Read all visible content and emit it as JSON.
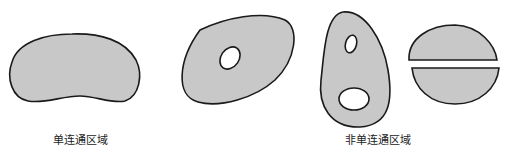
{
  "figure": {
    "colors": {
      "region_fill": "#c8c8c8",
      "outline": "#1a1a1a",
      "hole_fill": "#ffffff",
      "background": "#ffffff"
    },
    "groups": [
      {
        "label": "单连通区域",
        "shapes": [
          "bean-shaped region without holes"
        ]
      },
      {
        "label": "非单连通区域",
        "shapes": [
          "tilted oval region with one hole",
          "egg-shaped region with two holes",
          "ellipse split into two disconnected halves"
        ]
      }
    ]
  }
}
